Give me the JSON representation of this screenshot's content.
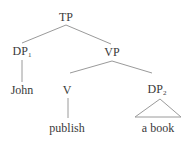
{
  "diagram": {
    "type": "syntax-tree",
    "line_color": "#9a9a9a",
    "text_color": "#3a3a3a",
    "nodes": {
      "tp": {
        "label": "TP",
        "sub": ""
      },
      "dp1": {
        "label": "DP",
        "sub": "1"
      },
      "vp": {
        "label": "VP",
        "sub": ""
      },
      "v": {
        "label": "V",
        "sub": ""
      },
      "dp2": {
        "label": "DP",
        "sub": "2"
      }
    },
    "leaves": {
      "john": "John",
      "publish": "publish",
      "a_book": "a book"
    },
    "edges": [
      [
        "TP",
        "DP1"
      ],
      [
        "TP",
        "VP"
      ],
      [
        "DP1",
        "John"
      ],
      [
        "VP",
        "V"
      ],
      [
        "VP",
        "DP2"
      ],
      [
        "V",
        "publish"
      ],
      [
        "DP2",
        "a book (triangle)"
      ]
    ]
  }
}
